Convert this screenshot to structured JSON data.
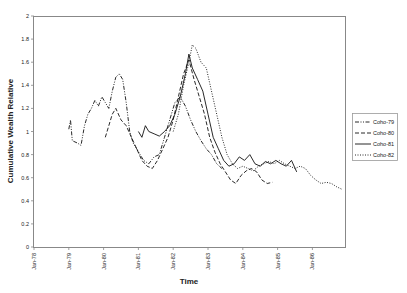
{
  "chart_data": {
    "type": "line",
    "title": "",
    "xlabel": "Time",
    "ylabel": "Cumulative Wealth Relative",
    "ylim": [
      0,
      2
    ],
    "yticks": [
      "0",
      "0.2",
      "0.4",
      "0.6",
      "0.8",
      "1",
      "1.2",
      "1.4",
      "1.6",
      "1.8",
      "2"
    ],
    "xticks": [
      "Jan-78",
      "Jan-79",
      "Jan-80",
      "Jan-81",
      "Jan-82",
      "Jan-83",
      "Jan-84",
      "Jan-85",
      "Jan-86"
    ],
    "grid": false,
    "legend_position": "right",
    "series": [
      {
        "name": "Coho-79",
        "style": "dash-dot-dot",
        "points": [
          [
            1979.0,
            1.02
          ],
          [
            1979.05,
            1.1
          ],
          [
            1979.1,
            0.92
          ],
          [
            1979.25,
            0.9
          ],
          [
            1979.35,
            0.88
          ],
          [
            1979.45,
            1.05
          ],
          [
            1979.55,
            1.15
          ],
          [
            1979.65,
            1.2
          ],
          [
            1979.75,
            1.27
          ],
          [
            1979.85,
            1.22
          ],
          [
            1979.95,
            1.3
          ],
          [
            1980.05,
            1.25
          ],
          [
            1980.15,
            1.2
          ],
          [
            1980.25,
            1.35
          ],
          [
            1980.35,
            1.47
          ],
          [
            1980.45,
            1.5
          ],
          [
            1980.55,
            1.45
          ],
          [
            1980.65,
            1.25
          ],
          [
            1980.75,
            1.0
          ],
          [
            1980.85,
            0.9
          ],
          [
            1980.95,
            0.85
          ],
          [
            1981.05,
            0.8
          ],
          [
            1981.15,
            0.75
          ],
          [
            1981.3,
            0.72
          ],
          [
            1981.45,
            0.78
          ],
          [
            1981.6,
            0.8
          ],
          [
            1981.75,
            0.95
          ],
          [
            1981.9,
            1.1
          ],
          [
            1982.05,
            1.25
          ],
          [
            1982.2,
            1.3
          ],
          [
            1982.35,
            1.22
          ],
          [
            1982.5,
            1.1
          ],
          [
            1982.65,
            1.0
          ],
          [
            1982.8,
            0.92
          ],
          [
            1982.95,
            0.85
          ],
          [
            1983.1,
            0.8
          ],
          [
            1983.25,
            0.72
          ],
          [
            1983.4,
            0.68
          ]
        ]
      },
      {
        "name": "Coho-80",
        "style": "dashed",
        "points": [
          [
            1980.05,
            0.95
          ],
          [
            1980.15,
            1.05
          ],
          [
            1980.25,
            1.15
          ],
          [
            1980.35,
            1.2
          ],
          [
            1980.5,
            1.1
          ],
          [
            1980.65,
            1.05
          ],
          [
            1980.8,
            0.95
          ],
          [
            1980.95,
            0.85
          ],
          [
            1981.1,
            0.75
          ],
          [
            1981.25,
            0.7
          ],
          [
            1981.4,
            0.68
          ],
          [
            1981.55,
            0.75
          ],
          [
            1981.7,
            0.85
          ],
          [
            1981.85,
            0.95
          ],
          [
            1982.0,
            1.1
          ],
          [
            1982.15,
            1.3
          ],
          [
            1982.3,
            1.5
          ],
          [
            1982.45,
            1.62
          ],
          [
            1982.6,
            1.45
          ],
          [
            1982.75,
            1.3
          ],
          [
            1982.9,
            1.15
          ],
          [
            1983.05,
            0.95
          ],
          [
            1983.2,
            0.82
          ],
          [
            1983.35,
            0.72
          ],
          [
            1983.5,
            0.65
          ],
          [
            1983.65,
            0.58
          ],
          [
            1983.8,
            0.55
          ],
          [
            1983.95,
            0.62
          ],
          [
            1984.1,
            0.66
          ],
          [
            1984.25,
            0.68
          ],
          [
            1984.4,
            0.65
          ],
          [
            1984.55,
            0.58
          ],
          [
            1984.7,
            0.55
          ],
          [
            1984.85,
            0.56
          ]
        ]
      },
      {
        "name": "Coho-81",
        "style": "solid",
        "points": [
          [
            1981.0,
            1.0
          ],
          [
            1981.1,
            0.95
          ],
          [
            1981.2,
            1.05
          ],
          [
            1981.3,
            1.0
          ],
          [
            1981.45,
            0.98
          ],
          [
            1981.6,
            0.96
          ],
          [
            1981.75,
            1.0
          ],
          [
            1981.9,
            1.05
          ],
          [
            1982.05,
            1.15
          ],
          [
            1982.2,
            1.3
          ],
          [
            1982.35,
            1.5
          ],
          [
            1982.45,
            1.67
          ],
          [
            1982.55,
            1.55
          ],
          [
            1982.7,
            1.45
          ],
          [
            1982.85,
            1.35
          ],
          [
            1983.0,
            1.15
          ],
          [
            1983.15,
            0.95
          ],
          [
            1983.3,
            0.85
          ],
          [
            1983.45,
            0.75
          ],
          [
            1983.6,
            0.7
          ],
          [
            1983.75,
            0.72
          ],
          [
            1983.9,
            0.78
          ],
          [
            1984.05,
            0.75
          ],
          [
            1984.2,
            0.8
          ],
          [
            1984.35,
            0.72
          ],
          [
            1984.5,
            0.7
          ],
          [
            1984.65,
            0.74
          ],
          [
            1984.8,
            0.72
          ],
          [
            1984.95,
            0.75
          ],
          [
            1985.1,
            0.72
          ],
          [
            1985.25,
            0.7
          ],
          [
            1985.4,
            0.75
          ],
          [
            1985.55,
            0.65
          ]
        ]
      },
      {
        "name": "Coho-82",
        "style": "dotted",
        "points": [
          [
            1982.0,
            1.0
          ],
          [
            1982.15,
            1.15
          ],
          [
            1982.3,
            1.4
          ],
          [
            1982.45,
            1.6
          ],
          [
            1982.55,
            1.75
          ],
          [
            1982.65,
            1.72
          ],
          [
            1982.8,
            1.6
          ],
          [
            1982.95,
            1.55
          ],
          [
            1983.1,
            1.35
          ],
          [
            1983.25,
            1.15
          ],
          [
            1983.4,
            0.95
          ],
          [
            1983.55,
            0.8
          ],
          [
            1983.7,
            0.72
          ],
          [
            1983.85,
            0.68
          ],
          [
            1984.0,
            0.7
          ],
          [
            1984.15,
            0.68
          ],
          [
            1984.3,
            0.66
          ],
          [
            1984.45,
            0.7
          ],
          [
            1984.6,
            0.72
          ],
          [
            1984.75,
            0.74
          ],
          [
            1984.9,
            0.72
          ],
          [
            1985.05,
            0.75
          ],
          [
            1985.2,
            0.72
          ],
          [
            1985.35,
            0.7
          ],
          [
            1985.5,
            0.68
          ],
          [
            1985.65,
            0.7
          ],
          [
            1985.8,
            0.68
          ],
          [
            1985.95,
            0.62
          ],
          [
            1986.1,
            0.58
          ],
          [
            1986.25,
            0.55
          ],
          [
            1986.4,
            0.56
          ],
          [
            1986.55,
            0.55
          ],
          [
            1986.7,
            0.52
          ],
          [
            1986.85,
            0.5
          ]
        ]
      }
    ]
  }
}
